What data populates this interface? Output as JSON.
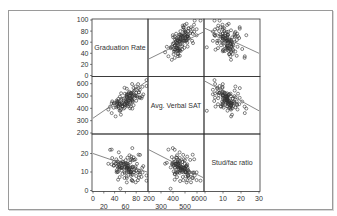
{
  "chart_data": {
    "type": "scatter",
    "subtype": "scatterplot-matrix",
    "title": "",
    "variables": [
      "Graduation Rate",
      "Avg. Verbal SAT",
      "Stud/fac ratio"
    ],
    "axes": {
      "Graduation Rate": {
        "range": [
          0,
          100
        ],
        "ticks_y": [
          0,
          20,
          40,
          60,
          80,
          100
        ],
        "ticks_x_upper": [
          0,
          40,
          80
        ],
        "ticks_x_lower": [
          20,
          60
        ]
      },
      "Avg. Verbal SAT": {
        "range": [
          200,
          650
        ],
        "ticks_y": [
          200,
          300,
          400,
          500,
          600
        ],
        "ticks_x_upper": [
          200,
          400,
          600
        ],
        "ticks_x_lower": [
          300,
          500
        ]
      },
      "Stud/fac ratio": {
        "range": [
          0,
          30
        ],
        "ticks_y": [
          0,
          10,
          20
        ],
        "ticks_x_upper": [
          0,
          10,
          20,
          30
        ]
      }
    },
    "grid": false,
    "legend": null,
    "fit_lines": [
      {
        "x": "Avg. Verbal SAT",
        "y": "Graduation Rate",
        "slope_sign": "positive",
        "from": [
          200,
          30
        ],
        "to": [
          650,
          78
        ]
      },
      {
        "x": "Stud/fac ratio",
        "y": "Graduation Rate",
        "slope_sign": "negative",
        "from": [
          0,
          85
        ],
        "to": [
          30,
          40
        ]
      },
      {
        "x": "Graduation Rate",
        "y": "Avg. Verbal SAT",
        "slope_sign": "positive",
        "from": [
          0,
          320
        ],
        "to": [
          100,
          620
        ]
      },
      {
        "x": "Stud/fac ratio",
        "y": "Avg. Verbal SAT",
        "slope_sign": "negative",
        "from": [
          0,
          620
        ],
        "to": [
          30,
          380
        ]
      },
      {
        "x": "Graduation Rate",
        "y": "Stud/fac ratio",
        "slope_sign": "negative",
        "from": [
          0,
          20
        ],
        "to": [
          100,
          10
        ]
      },
      {
        "x": "Avg. Verbal SAT",
        "y": "Stud/fac ratio",
        "slope_sign": "negative",
        "from": [
          200,
          22
        ],
        "to": [
          650,
          7
        ]
      }
    ],
    "approx_point_cloud": {
      "Graduation Rate": {
        "center": 62,
        "spread": 14
      },
      "Avg. Verbal SAT": {
        "center": 470,
        "spread": 60
      },
      "Stud/fac ratio": {
        "center": 13,
        "spread": 4
      },
      "n_points_approx": 120
    },
    "colors": {
      "frame": "#9a9a9a",
      "axis": "#333333",
      "marker": "#333333",
      "fit_line": "#555555"
    }
  }
}
